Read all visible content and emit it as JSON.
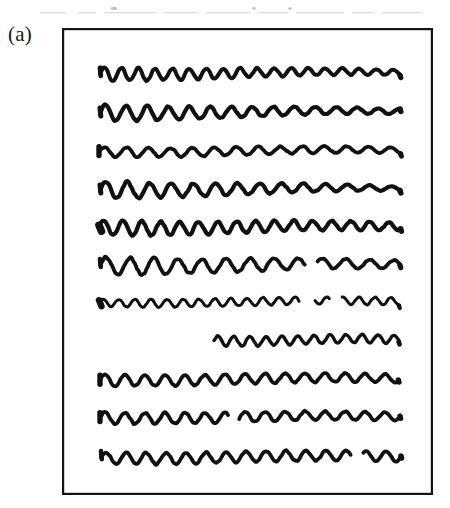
{
  "figure": {
    "label": "(a)",
    "caption_fragment": "",
    "box": {
      "x": 62,
      "y": 28,
      "width": 371,
      "height": 467,
      "border_color": "#141414",
      "border_width": 2.2,
      "fill": "#ffffff"
    },
    "ink_color": "#111111",
    "background_color": "#ffffff",
    "row_count": 11,
    "rows": [
      {
        "index": 1,
        "name": "scribble-row-1",
        "y": 73,
        "x_start": 100,
        "x_end": 402,
        "stroke_width": 4.0,
        "amplitude_start": 7,
        "amplitude_end": 2.5,
        "wavelength": 17,
        "lead_in": "hook",
        "broken": false,
        "gaps": []
      },
      {
        "index": 2,
        "name": "scribble-row-2",
        "y": 112,
        "x_start": 100,
        "x_end": 402,
        "stroke_width": 4.2,
        "amplitude_start": 8,
        "amplitude_end": 2.5,
        "wavelength": 21,
        "lead_in": "hook",
        "broken": false,
        "gaps": []
      },
      {
        "index": 3,
        "name": "scribble-row-3",
        "y": 151,
        "x_start": 99,
        "x_end": 403,
        "stroke_width": 3.8,
        "amplitude_start": 5,
        "amplitude_end": 3,
        "wavelength": 22,
        "lead_in": "tick",
        "broken": false,
        "gaps": []
      },
      {
        "index": 4,
        "name": "scribble-row-4",
        "y": 189,
        "x_start": 100,
        "x_end": 402,
        "stroke_width": 4.2,
        "amplitude_start": 9,
        "amplitude_end": 2,
        "wavelength": 22,
        "lead_in": "hook",
        "broken": false,
        "gaps": []
      },
      {
        "index": 5,
        "name": "scribble-row-5",
        "y": 227,
        "x_start": 99,
        "x_end": 402,
        "stroke_width": 4.2,
        "amplitude_start": 8,
        "amplitude_end": 4,
        "wavelength": 19,
        "lead_in": "blob",
        "broken": false,
        "gaps": []
      },
      {
        "index": 6,
        "name": "scribble-row-6",
        "y": 265,
        "x_start": 100,
        "x_end": 401,
        "stroke_width": 3.8,
        "amplitude_start": 9,
        "amplitude_end": 4,
        "wavelength": 24,
        "lead_in": "hook",
        "broken": true,
        "gaps": [
          [
            306,
            316
          ]
        ]
      },
      {
        "index": 7,
        "name": "scribble-row-7",
        "y": 302,
        "x_start": 99,
        "x_end": 400,
        "stroke_width": 3.0,
        "amplitude_start": 4,
        "amplitude_end": 4,
        "wavelength": 16,
        "lead_in": "blob",
        "broken": true,
        "gaps": [
          [
            300,
            314
          ],
          [
            330,
            342
          ]
        ]
      },
      {
        "index": 8,
        "name": "scribble-row-8",
        "y": 340,
        "x_start": 214,
        "x_end": 400,
        "stroke_width": 3.4,
        "amplitude_start": 5,
        "amplitude_end": 4,
        "wavelength": 16,
        "lead_in": "none",
        "broken": false,
        "gaps": []
      },
      {
        "index": 9,
        "name": "scribble-row-9",
        "y": 379,
        "x_start": 100,
        "x_end": 400,
        "stroke_width": 3.8,
        "amplitude_start": 6,
        "amplitude_end": 4,
        "wavelength": 20,
        "lead_in": "tick",
        "broken": false,
        "gaps": []
      },
      {
        "index": 10,
        "name": "scribble-row-10",
        "y": 417,
        "x_start": 100,
        "x_end": 401,
        "stroke_width": 3.8,
        "amplitude_start": 6,
        "amplitude_end": 4,
        "wavelength": 20,
        "lead_in": "tick",
        "broken": true,
        "gaps": [
          [
            228,
            238
          ]
        ]
      },
      {
        "index": 11,
        "name": "scribble-row-11",
        "y": 457,
        "x_start": 101,
        "x_end": 402,
        "stroke_width": 3.8,
        "amplitude_start": 6,
        "amplitude_end": 5,
        "wavelength": 20,
        "lead_in": "hook",
        "broken": true,
        "gaps": [
          [
            352,
            362
          ]
        ]
      }
    ]
  }
}
